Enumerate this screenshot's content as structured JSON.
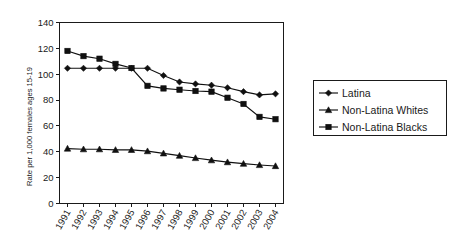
{
  "chart_data": {
    "type": "line",
    "title": "",
    "xlabel": "",
    "ylabel": "Rate per 1,000 females ages 15-19",
    "ylim": [
      0,
      140
    ],
    "yticks": [
      0,
      20,
      40,
      60,
      80,
      100,
      120,
      140
    ],
    "ytick_labels": [
      "0",
      "20",
      "40",
      "60",
      "80",
      "100",
      "120",
      "140"
    ],
    "grid": false,
    "legend_position": "right",
    "categories": [
      "1991",
      "1992",
      "1993",
      "1994",
      "1995",
      "1996",
      "1997",
      "1998",
      "1999",
      "2000",
      "2001",
      "2002",
      "2003",
      "2004"
    ],
    "series": [
      {
        "name": "Latina",
        "marker": "diamond",
        "values": [
          104.6,
          104.6,
          104.6,
          104.6,
          104.6,
          104.6,
          99.0,
          94.0,
          92.5,
          91.5,
          89.5,
          86.5,
          84.0,
          84.8
        ]
      },
      {
        "name": "Non-Latina Whites",
        "marker": "triangle",
        "values": [
          42.5,
          42.0,
          42.0,
          41.5,
          41.5,
          40.5,
          38.8,
          37.0,
          35.2,
          33.5,
          32.0,
          30.8,
          29.8,
          29.0
        ]
      },
      {
        "name": "Non-Latina Blacks",
        "marker": "square",
        "values": [
          118.0,
          114.0,
          112.0,
          108.0,
          104.8,
          91.0,
          89.0,
          88.0,
          87.0,
          86.5,
          81.8,
          77.0,
          67.0,
          65.2
        ]
      }
    ]
  },
  "legend": {
    "entries": [
      {
        "label": "Latina",
        "marker": "diamond"
      },
      {
        "label": "Non-Latina Whites",
        "marker": "triangle"
      },
      {
        "label": "Non-Latina Blacks",
        "marker": "square"
      }
    ]
  },
  "colors": {
    "series": "#101010",
    "axis": "#1a1a1a",
    "background": "#ffffff"
  }
}
